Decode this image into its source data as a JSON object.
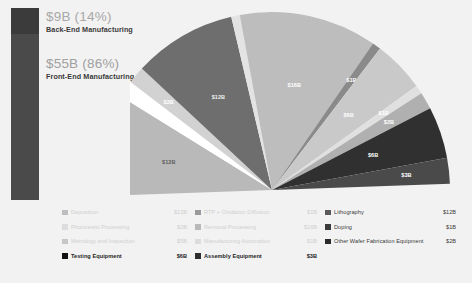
{
  "summary": {
    "back_end": {
      "value": "$9B (14%)",
      "label": "Back-End Manufacturing",
      "color": "#3b3b3b",
      "percent": 14
    },
    "front_end": {
      "value": "$55B (86%)",
      "label": "Front-End Manufacturing",
      "color": "#4a4a4a",
      "percent": 86
    }
  },
  "chart_data": {
    "type": "pie",
    "title": "",
    "unit": "$B",
    "total": "$64B",
    "legend_position": "bottom",
    "categories": [
      "Deposition",
      "Photoresist Processing",
      "Metrology and Inspection",
      "Testing Equipment",
      "RTP + Oxidation Diffusion",
      "Removal Processing",
      "Manufacturing Automation",
      "Assembly Equipment",
      "Lithography",
      "Doping",
      "Other Wafer Fabrication Equipment"
    ],
    "values": [
      12,
      2,
      5,
      6,
      1,
      16,
      1,
      3,
      12,
      1,
      2
    ],
    "labels": [
      "$12B",
      "$2B",
      "$5B",
      "$6B",
      "$1B",
      "$16B",
      "$1B",
      "$3B",
      "$12B",
      "$1B",
      "$2B"
    ],
    "colors": [
      "#b9b9b9",
      "#d4d4d4",
      "#c6c6c6",
      "#1d1d1d",
      "#8f8f8f",
      "#bcbcbc",
      "#cccccc",
      "#6f6f6f",
      "#5a5a5a",
      "#dcdcdc",
      "#a5a5a5"
    ],
    "slice_labels": [
      {
        "text": "$12B",
        "color": "#5f5f5f"
      },
      {
        "text": "$2B",
        "color": "#ffffff"
      },
      {
        "text": "$12B",
        "color": "#e8e8e8"
      },
      {
        "text": "$16B",
        "color": "#ffffff"
      },
      {
        "text": "$1B",
        "color": "#ffffff"
      },
      {
        "text": "$6B",
        "color": "#ffffff"
      },
      {
        "text": "$1B",
        "color": "#f0f0f0"
      },
      {
        "text": "$2B",
        "color": "#ffffff"
      },
      {
        "text": "$6B",
        "color": "#ffffff"
      },
      {
        "text": "$3B",
        "color": "#ffffff"
      }
    ]
  },
  "legend": {
    "rows": [
      [
        {
          "name": "Deposition",
          "value": "$12B",
          "color": "#bdbdbd",
          "style": "faded"
        },
        {
          "name": "RTP + Oxidation Diffusion",
          "value": "$1B",
          "color": "#9a9a9a",
          "style": "faded"
        },
        {
          "name": "Lithography",
          "value": "$12B",
          "color": "#5a5a5a",
          "style": "normal"
        }
      ],
      [
        {
          "name": "Photoresist Processing",
          "value": "$2B",
          "color": "#dcdcdc",
          "style": "ghost"
        },
        {
          "name": "Removal Processing",
          "value": "$16B",
          "color": "#b9b9b9",
          "style": "faded"
        },
        {
          "name": "Doping",
          "value": "$1B",
          "color": "#3a3a3a",
          "style": "normal"
        }
      ],
      [
        {
          "name": "Metrology and Inspection",
          "value": "$5B",
          "color": "#c6c6c6",
          "style": "faded"
        },
        {
          "name": "Manufacturing Automation",
          "value": "$1B",
          "color": "#dcdcdc",
          "style": "ghost"
        },
        {
          "name": "Other Wafer Fabrication Equipment",
          "value": "$2B",
          "color": "#2a2a2a",
          "style": "normal"
        }
      ],
      [
        {
          "name": "Testing Equipment",
          "value": "$6B",
          "color": "#111111",
          "style": "dark"
        },
        {
          "name": "Assembly Equipment",
          "value": "$3B",
          "color": "#2e2e2e",
          "style": "dark"
        },
        {
          "name": "",
          "value": "",
          "color": "transparent",
          "style": "empty"
        }
      ]
    ]
  }
}
